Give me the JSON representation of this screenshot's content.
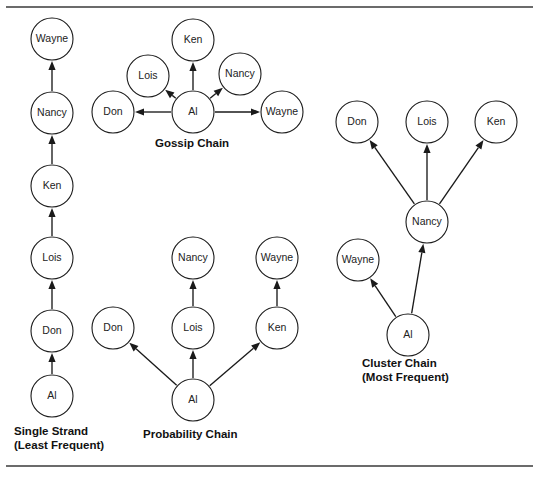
{
  "figure": {
    "background_color": "#ffffff",
    "line_color": "#1a1a1a",
    "rule_color": "#3a3a3a",
    "top_rule_y": 7,
    "bottom_rule_y": 466
  },
  "captions": {
    "single_strand": "Single Strand\n(Least Frequent)",
    "gossip": "Gossip Chain",
    "probability": "Probability Chain",
    "cluster": "Cluster Chain\n(Most Frequent)"
  },
  "chart_data": {
    "type": "diagram",
    "title": "",
    "people": [
      "Al",
      "Don",
      "Lois",
      "Ken",
      "Nancy",
      "Wayne"
    ],
    "networks": [
      {
        "id": "single-strand",
        "name": "Single Strand",
        "qualifier": "(Least Frequent)",
        "nodes": [
          {
            "id": "ss-al",
            "label": "Al",
            "cx": 52,
            "cy": 396,
            "r": 21
          },
          {
            "id": "ss-don",
            "label": "Don",
            "cx": 52,
            "cy": 331,
            "r": 21
          },
          {
            "id": "ss-lois",
            "label": "Lois",
            "cx": 52,
            "cy": 258,
            "r": 21
          },
          {
            "id": "ss-ken",
            "label": "Ken",
            "cx": 52,
            "cy": 186,
            "r": 21
          },
          {
            "id": "ss-nancy",
            "label": "Nancy",
            "cx": 52,
            "cy": 113,
            "r": 21
          },
          {
            "id": "ss-wayne",
            "label": "Wayne",
            "cx": 52,
            "cy": 39,
            "r": 21
          }
        ],
        "edges": [
          {
            "from": "ss-al",
            "to": "ss-don"
          },
          {
            "from": "ss-don",
            "to": "ss-lois"
          },
          {
            "from": "ss-lois",
            "to": "ss-ken"
          },
          {
            "from": "ss-ken",
            "to": "ss-nancy"
          },
          {
            "from": "ss-nancy",
            "to": "ss-wayne"
          }
        ]
      },
      {
        "id": "gossip",
        "name": "Gossip Chain",
        "qualifier": "",
        "nodes": [
          {
            "id": "g-al",
            "label": "Al",
            "cx": 193,
            "cy": 112,
            "r": 21
          },
          {
            "id": "g-don",
            "label": "Don",
            "cx": 113,
            "cy": 112,
            "r": 21
          },
          {
            "id": "g-wayne",
            "label": "Wayne",
            "cx": 282,
            "cy": 112,
            "r": 21
          },
          {
            "id": "g-lois",
            "label": "Lois",
            "cx": 148,
            "cy": 76,
            "r": 21
          },
          {
            "id": "g-nancy",
            "label": "Nancy",
            "cx": 240,
            "cy": 74,
            "r": 21
          },
          {
            "id": "g-ken",
            "label": "Ken",
            "cx": 193,
            "cy": 40,
            "r": 21
          }
        ],
        "edges": [
          {
            "from": "g-al",
            "to": "g-don"
          },
          {
            "from": "g-al",
            "to": "g-lois"
          },
          {
            "from": "g-al",
            "to": "g-ken"
          },
          {
            "from": "g-al",
            "to": "g-nancy"
          },
          {
            "from": "g-al",
            "to": "g-wayne"
          }
        ]
      },
      {
        "id": "probability",
        "name": "Probability Chain",
        "qualifier": "",
        "nodes": [
          {
            "id": "p-al",
            "label": "Al",
            "cx": 193,
            "cy": 400,
            "r": 21
          },
          {
            "id": "p-don",
            "label": "Don",
            "cx": 113,
            "cy": 328,
            "r": 21
          },
          {
            "id": "p-lois",
            "label": "Lois",
            "cx": 193,
            "cy": 328,
            "r": 21
          },
          {
            "id": "p-ken",
            "label": "Ken",
            "cx": 277,
            "cy": 328,
            "r": 21
          },
          {
            "id": "p-nancy",
            "label": "Nancy",
            "cx": 193,
            "cy": 258,
            "r": 21
          },
          {
            "id": "p-wayne",
            "label": "Wayne",
            "cx": 277,
            "cy": 258,
            "r": 21
          }
        ],
        "edges": [
          {
            "from": "p-al",
            "to": "p-don"
          },
          {
            "from": "p-al",
            "to": "p-lois"
          },
          {
            "from": "p-al",
            "to": "p-ken"
          },
          {
            "from": "p-lois",
            "to": "p-nancy"
          },
          {
            "from": "p-ken",
            "to": "p-wayne"
          }
        ]
      },
      {
        "id": "cluster",
        "name": "Cluster Chain",
        "qualifier": "(Most Frequent)",
        "nodes": [
          {
            "id": "c-al",
            "label": "Al",
            "cx": 408,
            "cy": 335,
            "r": 21
          },
          {
            "id": "c-wayne",
            "label": "Wayne",
            "cx": 358,
            "cy": 260,
            "r": 21
          },
          {
            "id": "c-nancy",
            "label": "Nancy",
            "cx": 427,
            "cy": 222,
            "r": 21
          },
          {
            "id": "c-don",
            "label": "Don",
            "cx": 357,
            "cy": 122,
            "r": 21
          },
          {
            "id": "c-lois",
            "label": "Lois",
            "cx": 427,
            "cy": 122,
            "r": 21
          },
          {
            "id": "c-ken",
            "label": "Ken",
            "cx": 496,
            "cy": 122,
            "r": 21
          }
        ],
        "edges": [
          {
            "from": "c-al",
            "to": "c-wayne"
          },
          {
            "from": "c-al",
            "to": "c-nancy"
          },
          {
            "from": "c-nancy",
            "to": "c-don"
          },
          {
            "from": "c-nancy",
            "to": "c-lois"
          },
          {
            "from": "c-nancy",
            "to": "c-ken"
          }
        ]
      }
    ]
  },
  "caption_positions": {
    "single_strand": {
      "left": 14,
      "top": 425
    },
    "gossip": {
      "left": 155,
      "top": 137
    },
    "probability": {
      "left": 143,
      "top": 428
    },
    "cluster": {
      "left": 362,
      "top": 357
    }
  }
}
